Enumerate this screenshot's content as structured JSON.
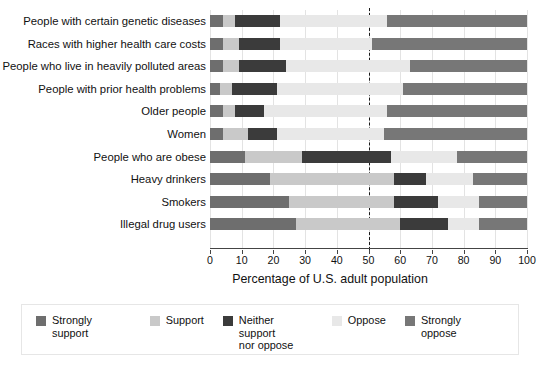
{
  "chart_data": {
    "type": "bar",
    "subtype": "stacked-horizontal-100",
    "title": "",
    "xlabel": "Percentage of U.S. adult population",
    "ylabel": "",
    "xlim": [
      0,
      100
    ],
    "xticks": [
      "0",
      "10",
      "20",
      "30",
      "40",
      "50",
      "60",
      "70",
      "80",
      "90",
      "100"
    ],
    "grid": true,
    "legend_position": "bottom",
    "reference_line": 50,
    "categories": [
      "People with certain genetic diseases",
      "Races with higher health care costs",
      "People who live in heavily polluted areas",
      "People with prior health problems",
      "Older people",
      "Women",
      "People who are obese",
      "Heavy drinkers",
      "Smokers",
      "Illegal drug users"
    ],
    "series": [
      {
        "name": "Strongly support",
        "color": "#6e6e6e",
        "values": [
          4,
          4,
          4,
          3,
          4,
          4,
          11,
          19,
          25,
          27
        ]
      },
      {
        "name": "Support",
        "color": "#c9c9c9",
        "values": [
          4,
          5,
          5,
          4,
          4,
          8,
          18,
          39,
          33,
          33
        ]
      },
      {
        "name": "Neither support\nnor oppose",
        "color": "#3b3b3b",
        "values": [
          14,
          13,
          15,
          14,
          9,
          9,
          28,
          10,
          14,
          15
        ]
      },
      {
        "name": "Oppose",
        "color": "#e8e8e8",
        "values": [
          34,
          29,
          39,
          40,
          39,
          34,
          21,
          15,
          13,
          10
        ]
      },
      {
        "name": "Strongly oppose",
        "color": "#777777",
        "values": [
          44,
          49,
          37,
          39,
          44,
          45,
          22,
          17,
          15,
          15
        ]
      }
    ]
  },
  "legend": {
    "items": [
      {
        "label": "Strongly support"
      },
      {
        "label": "Support"
      },
      {
        "label": "Neither support\nnor oppose"
      },
      {
        "label": "Oppose"
      },
      {
        "label": "Strongly oppose"
      }
    ]
  }
}
